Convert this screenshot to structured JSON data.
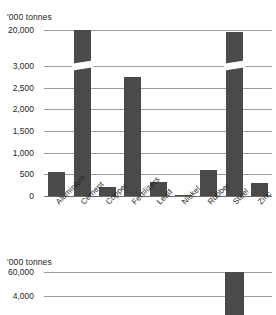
{
  "main": {
    "unit_label": "'000 tonnes",
    "axis_break": true
  },
  "inset": {
    "unit_label": "'000 tonnes"
  },
  "chart_data": [
    {
      "type": "bar",
      "title": "",
      "xlabel": "",
      "ylabel": "'000 tonnes",
      "categories": [
        "Aluminium",
        "Cement",
        "Copper",
        "Fertilizers",
        "Lead",
        "Nickel",
        "Rubber",
        "Steel",
        "Zinc"
      ],
      "values": [
        560,
        19900,
        210,
        2750,
        330,
        30,
        590,
        19200,
        290
      ],
      "ytick_labels": [
        "20,000",
        "3,000",
        "2,500",
        "2,000",
        "1,500",
        "1,000",
        "500",
        "0"
      ],
      "ytick_values": [
        20000,
        3000,
        2500,
        2000,
        1500,
        1000,
        500,
        0
      ],
      "axis_break_between": [
        3000,
        20000
      ],
      "ylim": [
        0,
        20000
      ],
      "grid": true,
      "legend": "none",
      "bar_color": "#4a4a4a",
      "gridline_color": "#9d9d9d",
      "notes": "Broken y-axis: linear 0-3,000 then jump to 20,000. Cement and Steel bars carry break slashes."
    },
    {
      "type": "bar",
      "title": "",
      "xlabel": "",
      "ylabel": "'000 tonnes",
      "categories": [
        "Steel"
      ],
      "values": [
        60000
      ],
      "ytick_labels": [
        "60,000",
        "4,000"
      ],
      "ytick_values": [
        60000,
        4000
      ],
      "axis_break_between": [
        4000,
        60000
      ],
      "ylim": [
        0,
        60000
      ],
      "grid": true,
      "legend": "none",
      "bar_color": "#4a4a4a",
      "gridline_color": "#9d9d9d",
      "notes": "Inset panel, single bar positioned under the Steel column with a break slash."
    }
  ]
}
